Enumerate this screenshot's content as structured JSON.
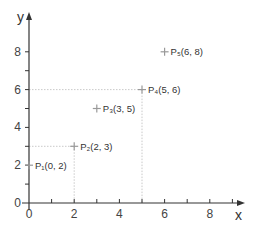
{
  "chart_data": {
    "type": "scatter",
    "title": "",
    "xlabel": "x",
    "ylabel": "y",
    "xlim": [
      0,
      9.5
    ],
    "ylim": [
      0,
      9
    ],
    "grid": false,
    "x_ticks": [
      "0",
      "2",
      "4",
      "6",
      "8"
    ],
    "y_ticks": [
      "0",
      "2",
      "4",
      "6",
      "8"
    ],
    "points": [
      {
        "name": "P1",
        "x": 0,
        "y": 2,
        "label": "P₁(0, 2)"
      },
      {
        "name": "P2",
        "x": 2,
        "y": 3,
        "label": "P₂(2, 3)"
      },
      {
        "name": "P3",
        "x": 3,
        "y": 5,
        "label": "P₃(3, 5)"
      },
      {
        "name": "P4",
        "x": 5,
        "y": 6,
        "label": "P₄(5, 6)"
      },
      {
        "name": "P5",
        "x": 6,
        "y": 8,
        "label": "P₅(6, 8)"
      }
    ],
    "guide_lines": [
      {
        "point": "P2",
        "dashed_to_axes": true
      },
      {
        "point": "P4",
        "dashed_to_axes": true
      }
    ],
    "colors": {
      "axis": "#333333",
      "marker": "#999999",
      "guide": "#bbbbbb"
    }
  }
}
